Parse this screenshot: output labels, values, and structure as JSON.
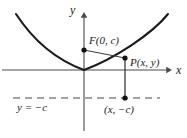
{
  "figure": {
    "colors": {
      "curve": "#1a1a1a",
      "axis": "#4a4a4a",
      "directrix": "#4a4a4a",
      "point": "#111111",
      "segment": "#3a3a3a",
      "background": "#ffffff"
    },
    "axes": {
      "x_label": "x",
      "y_label": "y",
      "origin": {
        "x": 84,
        "y": 70
      },
      "x_axis": {
        "x1": 2,
        "y1": 70,
        "x2": 172,
        "y2": 70
      },
      "y_axis": {
        "x1": 84,
        "y1": 14,
        "x2": 84,
        "y2": 131
      }
    },
    "curve": {
      "type": "parabola",
      "equation": "x^2 = 4cy",
      "vertex": {
        "x": 84,
        "y": 70
      },
      "path": "M 16,14 C 30,36 52,58 84,70 C 116,58 152,33 168,14"
    },
    "directrix": {
      "label": "y = −c",
      "y": 98,
      "x_start": 13,
      "x_end": 160,
      "dash": "7,5"
    },
    "points": [
      {
        "name": "focus",
        "label": "F(0, c)",
        "x": 84,
        "y": 50
      },
      {
        "name": "point-p",
        "label": "P(x, y)",
        "x": 125,
        "y": 58
      },
      {
        "name": "foot",
        "label": "(x, −c)",
        "x": 125,
        "y": 98
      }
    ],
    "segments": [
      {
        "name": "focus-to-p",
        "x1": 84,
        "y1": 50,
        "x2": 125,
        "y2": 58
      },
      {
        "name": "p-to-foot",
        "x1": 125,
        "y1": 58,
        "x2": 125,
        "y2": 98
      }
    ]
  }
}
